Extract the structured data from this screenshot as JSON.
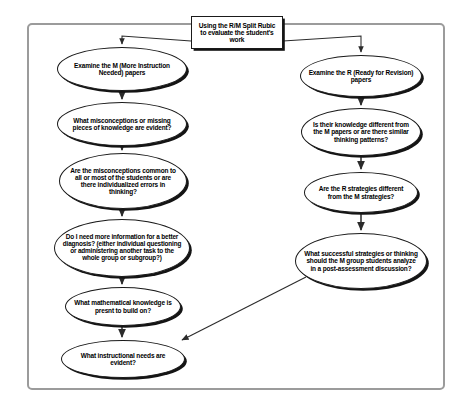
{
  "diagram": {
    "title_box": {
      "id": "title-box",
      "label": "Using the R/M Split Rubic to evaluate the student's work",
      "shape": "rectangle",
      "x": 191,
      "y": 16,
      "w": 92,
      "h": 33,
      "font_size": 6.6
    },
    "left_branch": {
      "name": "M papers branch",
      "nodes": [
        {
          "id": "examine-m",
          "label": "Examine the M (More Instruction Needed) papers",
          "shape": "ellipse",
          "x": 57,
          "y": 47,
          "w": 130,
          "h": 44,
          "font_size": 6.5
        },
        {
          "id": "misconceptions-evident",
          "label": "What misconceptions or missing pieces of knowledge are evident?",
          "shape": "ellipse",
          "x": 57,
          "y": 102,
          "w": 130,
          "h": 44,
          "font_size": 6.5
        },
        {
          "id": "common-or-individual",
          "label": "Are the misconceptions common to all or most of the students or are there individualized errors in thinking?",
          "shape": "ellipse",
          "x": 59,
          "y": 153,
          "w": 128,
          "h": 56,
          "font_size": 6.5
        },
        {
          "id": "more-information",
          "label": "Do I need more information for a better diagnosis? (either individual questioning or administering another task to the whole group or subgroup?)",
          "shape": "ellipse",
          "x": 54,
          "y": 219,
          "w": 136,
          "h": 58,
          "font_size": 6.4
        },
        {
          "id": "math-knowledge-present",
          "label": "What mathematical knowledge is presnt to build on?",
          "shape": "ellipse",
          "x": 65,
          "y": 287,
          "w": 116,
          "h": 39,
          "font_size": 6.5
        },
        {
          "id": "instructional-needs",
          "label": "What instructional needs are evident?",
          "shape": "ellipse",
          "x": 61,
          "y": 340,
          "w": 124,
          "h": 38,
          "font_size": 6.5
        }
      ]
    },
    "right_branch": {
      "name": "R papers branch",
      "nodes": [
        {
          "id": "examine-r",
          "label": "Examine the R (Ready for Revision) papers",
          "shape": "ellipse",
          "x": 300,
          "y": 55,
          "w": 122,
          "h": 42,
          "font_size": 6.5
        },
        {
          "id": "knowledge-different",
          "label": "Is their knowledge different from the M papers or are there similar thinking patterns?",
          "shape": "ellipse",
          "x": 301,
          "y": 108,
          "w": 120,
          "h": 48,
          "font_size": 6.5
        },
        {
          "id": "strategies-different",
          "label": "Are the R strategies different from the M strategies?",
          "shape": "ellipse",
          "x": 304,
          "y": 172,
          "w": 114,
          "h": 41,
          "font_size": 6.5
        },
        {
          "id": "successful-strategies",
          "label": "What successful strategies or thinking should the M group students analyze in a post-assessment discussion?",
          "shape": "ellipse",
          "x": 295,
          "y": 233,
          "w": 132,
          "h": 56,
          "font_size": 6.5
        }
      ]
    },
    "connectors": [
      {
        "id": "title-to-examine-m",
        "from": "title-box",
        "to": "examine-m",
        "style": "arrow-diagonal"
      },
      {
        "id": "title-to-examine-r",
        "from": "title-box",
        "to": "examine-r",
        "style": "arrow-diagonal"
      },
      {
        "id": "examine-m-to-misconceptions",
        "from": "examine-m",
        "to": "misconceptions-evident",
        "style": "arrow-vertical"
      },
      {
        "id": "misconceptions-to-common",
        "from": "misconceptions-evident",
        "to": "common-or-individual",
        "style": "arrow-vertical"
      },
      {
        "id": "common-to-more-information",
        "from": "common-or-individual",
        "to": "more-information",
        "style": "arrow-vertical"
      },
      {
        "id": "more-information-to-math-knowledge",
        "from": "more-information",
        "to": "math-knowledge-present",
        "style": "arrow-vertical"
      },
      {
        "id": "math-knowledge-to-instructional-needs",
        "from": "math-knowledge-present",
        "to": "instructional-needs",
        "style": "arrow-vertical"
      },
      {
        "id": "examine-r-to-knowledge-different",
        "from": "examine-r",
        "to": "knowledge-different",
        "style": "arrow-vertical"
      },
      {
        "id": "knowledge-different-to-strategies",
        "from": "knowledge-different",
        "to": "strategies-different",
        "style": "arrow-vertical"
      },
      {
        "id": "strategies-to-successful",
        "from": "strategies-different",
        "to": "successful-strategies",
        "style": "arrow-vertical"
      },
      {
        "id": "successful-to-instructional-needs",
        "from": "successful-strategies",
        "to": "instructional-needs",
        "style": "arrow-long-diagonal"
      }
    ],
    "colors": {
      "frame_border": "#9b9b9b",
      "node_stroke": "#1a1a1a",
      "node_fill": "#ffffff",
      "connector": "#2b2b2b",
      "text": "#000000",
      "background": "#ffffff"
    }
  }
}
